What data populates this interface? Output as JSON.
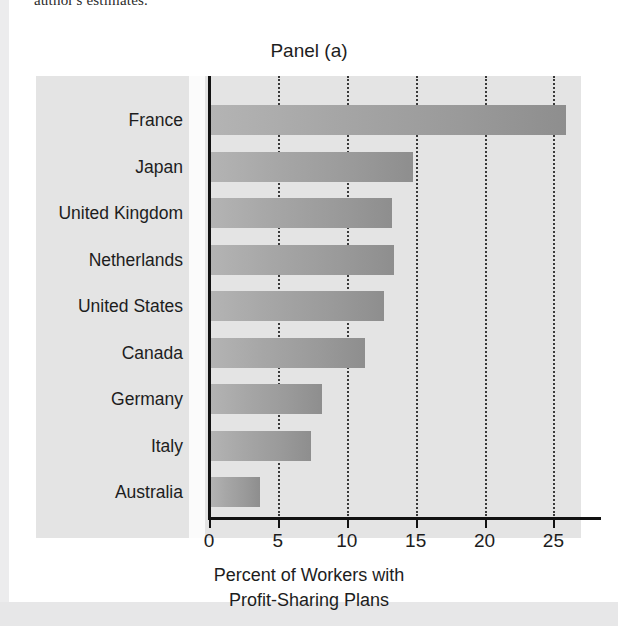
{
  "page": {
    "caption_fragment": "author's estimates."
  },
  "figure": {
    "panel_title": "Panel (a)",
    "xaxis_title_line1": "Percent of Workers with",
    "xaxis_title_line2": "Profit-Sharing Plans"
  },
  "chart_data": {
    "type": "bar",
    "orientation": "horizontal",
    "title": "Panel (a)",
    "xlabel": "Percent of Workers with Profit-Sharing Plans",
    "ylabel": "",
    "xlim": [
      0,
      27
    ],
    "ylim": [
      0,
      9
    ],
    "xticks": [
      0,
      5,
      10,
      15,
      20,
      25
    ],
    "xticklabels": [
      "0",
      "5",
      "10",
      "15",
      "20",
      "25"
    ],
    "grid": "vertical-dotted",
    "legend": "none",
    "categories": [
      "France",
      "Japan",
      "United Kingdom",
      "Netherlands",
      "United States",
      "Canada",
      "Germany",
      "Italy",
      "Australia"
    ],
    "values": [
      25.9,
      14.8,
      13.3,
      13.4,
      12.7,
      11.3,
      8.2,
      7.4,
      3.7
    ],
    "bar_color_left": "#b4b4b4",
    "bar_color_right": "#8e8e8e",
    "plot_background": "#e4e4e4",
    "axis_color": "#121212",
    "gridline_color": "#3a3a3a"
  }
}
